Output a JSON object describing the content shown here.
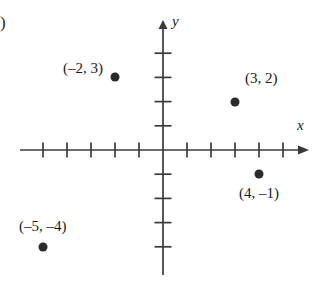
{
  "figure": {
    "corner_mark": ")",
    "x_axis_label": "x",
    "y_axis_label": "y"
  },
  "chart_data": {
    "type": "scatter",
    "title": "",
    "xlabel": "x",
    "ylabel": "y",
    "xlim": [
      -6,
      6
    ],
    "ylim": [
      -5,
      5
    ],
    "grid": false,
    "legend": "none",
    "x_ticks": [
      -5,
      -4,
      -3,
      -2,
      -1,
      1,
      2,
      3,
      4,
      5
    ],
    "y_ticks": [
      -4,
      -3,
      -2,
      -1,
      1,
      2,
      3,
      4
    ],
    "tick_labels_shown": false,
    "points": [
      {
        "label": "(–2, 3)",
        "x": -2,
        "y": 3,
        "label_position": "left"
      },
      {
        "label": "(3, 2)",
        "x": 3,
        "y": 2,
        "label_position": "upper-right"
      },
      {
        "label": "(4, –1)",
        "x": 4,
        "y": -1,
        "label_position": "below"
      },
      {
        "label": "(–5, –4)",
        "x": -5,
        "y": -4,
        "label_position": "above"
      }
    ],
    "colors": {
      "axis": "#3a3a3a",
      "point": "#2b2b2b",
      "background": "#ffffff"
    }
  }
}
